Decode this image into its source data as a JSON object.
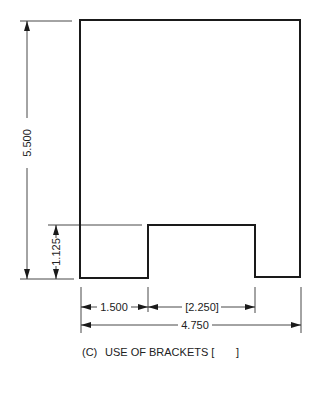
{
  "figure": {
    "caption": "(C)   USE OF BRACKETS [          ]",
    "caption_label": "(C)",
    "caption_text": "USE OF BRACKETS [",
    "caption_close": "]"
  },
  "dimensions": {
    "overall_height": "5.500",
    "notch_height": "1.125",
    "left_width": "1.500",
    "notch_width": "[2.250]",
    "overall_width": "4.750"
  },
  "colors": {
    "line": "#1a1a1a",
    "background": "#ffffff"
  }
}
